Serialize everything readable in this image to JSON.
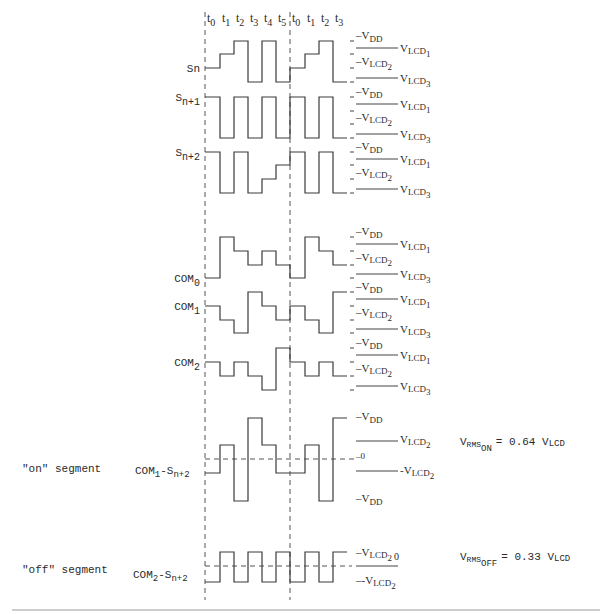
{
  "time_labels": [
    "t0",
    "t1",
    "t2",
    "t3",
    "t4",
    "t5",
    "t0",
    "t1",
    "t2",
    "t3"
  ],
  "time_x": [
    205,
    220,
    234,
    248,
    262,
    276,
    290,
    305,
    319,
    333,
    347
  ],
  "level_names": [
    "VDD",
    "VLCD1",
    "VLCD2",
    "VLCD3"
  ],
  "signals": [
    {
      "id": "Sn",
      "label_main": "Sn",
      "label_sub": "",
      "y": [
        41,
        54,
        68,
        82
      ],
      "levels": [
        "VLCD2",
        "VLCD1",
        "VDD",
        "VLCD3",
        "VDD",
        "VLCD3",
        "VLCD2",
        "VLCD1",
        "VDD",
        "VLCD3"
      ]
    },
    {
      "id": "Sn+1",
      "label_main": "S",
      "label_sub": "n+1",
      "y": [
        97,
        111,
        124,
        138
      ],
      "levels": [
        "VDD",
        "VLCD3",
        "VDD",
        "VLCD3",
        "VDD",
        "VLCD3",
        "VDD",
        "VLCD3",
        "VDD",
        "VLCD3"
      ]
    },
    {
      "id": "Sn+2",
      "label_main": "S",
      "label_sub": "n+2",
      "y": [
        152,
        165,
        179,
        193
      ],
      "levels": [
        "VDD",
        "VLCD3",
        "VDD",
        "VLCD3",
        "VLCD2",
        "VLCD1",
        "VDD",
        "VLCD3",
        "VDD",
        "VLCD3"
      ]
    },
    {
      "id": "COM0",
      "label_main": "COM",
      "label_sub": "0",
      "y": [
        237,
        251,
        265,
        278
      ],
      "levels": [
        "VLCD3",
        "VDD",
        "VLCD1",
        "VLCD2",
        "VLCD1",
        "VLCD2",
        "VLCD3",
        "VDD",
        "VLCD1",
        "VLCD2"
      ]
    },
    {
      "id": "COM1",
      "label_main": "COM",
      "label_sub": "1",
      "y": [
        292,
        306,
        320,
        333
      ],
      "levels": [
        "VLCD1",
        "VLCD2",
        "VLCD3",
        "VDD",
        "VLCD1",
        "VLCD2",
        "VLCD1",
        "VLCD2",
        "VLCD3",
        "VDD"
      ]
    },
    {
      "id": "COM2",
      "label_main": "COM",
      "label_sub": "2",
      "y": [
        348,
        362,
        376,
        390
      ],
      "levels": [
        "VLCD1",
        "VLCD2",
        "VLCD1",
        "VLCD2",
        "VLCD3",
        "VDD",
        "VLCD1",
        "VLCD2",
        "VLCD1",
        "VLCD2"
      ]
    }
  ],
  "level_labels": {
    "vdd": "V",
    "vdd_sub": "DD",
    "vlcd": "V",
    "lcd1_sub": "LCD",
    "lcd1_idx": "1",
    "lcd2_sub": "LCD",
    "lcd2_idx": "2",
    "lcd3_sub": "LCD",
    "lcd3_idx": "3"
  },
  "on_segment": {
    "label": "\"on\" segment",
    "signal_main": "COM",
    "signal_sub1": "1",
    "signal_mid": "-S",
    "signal_sub2": "n+2",
    "levels_y": {
      "VDD": 418,
      "VLCD2": 445,
      "0": 459,
      "-VLCD2": 473,
      "-VDD": 501
    },
    "levels": [
      "-VLCD2",
      "VLCD2",
      "-VDD",
      "VDD",
      "VLCD2",
      "-VLCD2",
      "-VLCD2",
      "VLCD2",
      "-VDD",
      "VDD"
    ],
    "axis_labels": {
      "top": "VDD",
      "upper": "VLCD2",
      "zero": "0",
      "lower": "-VLCD2",
      "bottom": "VDD"
    },
    "rms_main": "V",
    "rms_sub": "RMS",
    "rms_subsub": "ON",
    "rms_value": "= 0.64 V",
    "rms_unit_sub": "LCD"
  },
  "off_segment": {
    "label": "\"off\" segment",
    "signal_main": "COM",
    "signal_sub1": "2",
    "signal_mid": "-S",
    "signal_sub2": "n+2",
    "levels_y": {
      "high": 552,
      "zero": 566,
      "low": 582
    },
    "levels": [
      "low",
      "high",
      "low",
      "high",
      "low",
      "high",
      "low",
      "high",
      "low",
      "high"
    ],
    "axis_labels": {
      "top": "VLCD2",
      "zero": "0",
      "bottom": "-VLCD2"
    },
    "rms_main": "V",
    "rms_sub": "RMS",
    "rms_subsub": "OFF",
    "rms_value": "= 0.33 V",
    "rms_unit_sub": "LCD"
  },
  "text": {
    "minus": "-",
    "zero": "0",
    "rms_on_formula": "VRMS_ON = 0.64 VLCD",
    "rms_off_formula": "VRMS_OFF = 0.33 VLCD"
  }
}
